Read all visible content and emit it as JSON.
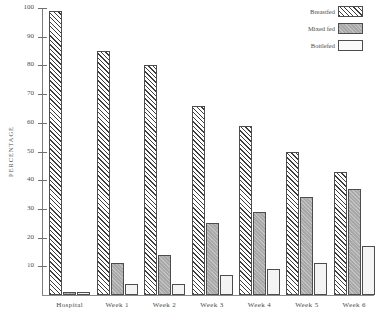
{
  "chart_data": {
    "type": "bar",
    "title": "",
    "xlabel": "",
    "ylabel": "PERCENTAGE",
    "ylim": [
      0,
      100
    ],
    "yticks": [
      10,
      20,
      30,
      40,
      50,
      60,
      70,
      80,
      90,
      100
    ],
    "grid": false,
    "legend_position": "top-right",
    "categories": [
      "Hospital",
      "Week 1",
      "Week 2",
      "Week 3",
      "Week 4",
      "Week 5",
      "Week 6"
    ],
    "series": [
      {
        "name": "Breastfed",
        "pattern": "diagonal-hatch",
        "values": [
          99,
          85,
          80,
          66,
          59,
          50,
          43
        ]
      },
      {
        "name": "Mixed fed",
        "pattern": "solid-gray",
        "values": [
          1,
          11,
          14,
          25,
          29,
          34,
          37
        ]
      },
      {
        "name": "Bottlefed",
        "pattern": "white-fill",
        "values": [
          1,
          4,
          4,
          7,
          9,
          11,
          17
        ]
      }
    ]
  },
  "axis": {
    "y_title": "PERCENTAGE",
    "tick_labels": [
      "100",
      "90",
      "80",
      "70",
      "60",
      "50",
      "40",
      "30",
      "20",
      "10"
    ]
  },
  "legend": {
    "items": [
      {
        "label": "Breastfed"
      },
      {
        "label": "Mixed fed"
      },
      {
        "label": "Bottlefed"
      }
    ]
  },
  "colors": {
    "hatch_stroke": "#3d3d3d",
    "mixed_fill": "#a8a8a8",
    "bottle_fill": "#f4f4f4",
    "bar_border": "#4d4d4d",
    "axis": "#7d7d7d",
    "text": "#4a4a4a"
  }
}
